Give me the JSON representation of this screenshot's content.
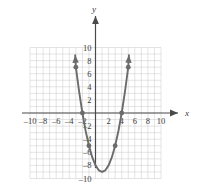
{
  "chart_data": {
    "type": "line",
    "title": "",
    "subtitle": "",
    "xlabel": "x",
    "ylabel": "y",
    "xlim": [
      -10,
      10
    ],
    "ylim": [
      -10,
      10
    ],
    "grid": true,
    "grid_step": 1,
    "legend": "none",
    "axis_arrows": "both-ends-both-axes",
    "curve_arrows": "both-ends",
    "x_ticks": [
      -10,
      -8,
      -6,
      -4,
      -2,
      2,
      4,
      6,
      8,
      10
    ],
    "x_tick_labels": [
      "-10",
      "-8",
      "-6",
      "-4",
      "-2",
      "2",
      "4",
      "6",
      "8",
      "10"
    ],
    "y_ticks": [
      10,
      8,
      6,
      4,
      2,
      -2,
      -4,
      -6,
      -8,
      -10
    ],
    "y_tick_labels": [
      "10",
      "8",
      "6",
      "4",
      "2",
      "-2",
      "-4",
      "-6",
      "-8",
      "-10"
    ],
    "series": [
      {
        "name": "parabola",
        "equation": "y = x^2 - 2x - 8",
        "vertex": [
          1,
          -9
        ],
        "x_intercepts": [
          -2,
          4
        ],
        "y_intercept": -8,
        "color": "#6b6b6b",
        "x": [
          -3.1,
          -3,
          -2.5,
          -2,
          -1.5,
          -1,
          -0.5,
          0,
          0.5,
          1,
          1.5,
          2,
          2.5,
          3,
          3.5,
          4,
          4.5,
          5,
          5.1
        ],
        "values": [
          8.81,
          7,
          3.25,
          0,
          -2.75,
          -5,
          -6.75,
          -8,
          -8.75,
          -9,
          -8.75,
          -8,
          -6.75,
          -5,
          -2.75,
          0,
          3.25,
          7,
          8.81
        ]
      }
    ],
    "points": [
      {
        "x": -3,
        "y": 7
      },
      {
        "x": -2,
        "y": 0
      },
      {
        "x": -1,
        "y": -5
      },
      {
        "x": 3,
        "y": -5
      },
      {
        "x": 4,
        "y": 0
      },
      {
        "x": 5,
        "y": 7
      }
    ],
    "colors": {
      "curve": "#6b6b6b",
      "point": "#6b6b6b",
      "axis": "#4a4a4a",
      "grid": "#c9c9c9",
      "text": "#3b3b3b",
      "background": "#ffffff"
    }
  }
}
